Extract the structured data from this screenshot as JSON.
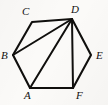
{
  "figure": {
    "type": "geometry-diagram",
    "shape_name": "hexagon",
    "canvas": {
      "width": 108,
      "height": 105
    },
    "background_color": "#fbfaf8",
    "line_color": "#100f0d",
    "label_color": "#121110",
    "vertices": [
      {
        "id": "A",
        "label": "A",
        "x": 30,
        "y": 88,
        "label_x": 24,
        "label_y": 90
      },
      {
        "id": "B",
        "label": "B",
        "x": 13,
        "y": 55,
        "label_x": 1,
        "label_y": 50
      },
      {
        "id": "C",
        "label": "C",
        "x": 32,
        "y": 22,
        "label_x": 22,
        "label_y": 6
      },
      {
        "id": "D",
        "label": "D",
        "x": 72,
        "y": 19,
        "label_x": 71,
        "label_y": 4
      },
      {
        "id": "E",
        "label": "E",
        "x": 91,
        "y": 55,
        "label_x": 96,
        "label_y": 50
      },
      {
        "id": "F",
        "label": "F",
        "x": 73,
        "y": 88,
        "label_x": 76,
        "label_y": 90
      }
    ],
    "outline_path": "M 30 88 L 13 55 L 32 22 L 72 19 L 91 55 L 73 88 Z",
    "edges": [
      {
        "from": "A",
        "to": "B"
      },
      {
        "from": "B",
        "to": "C"
      },
      {
        "from": "C",
        "to": "D"
      },
      {
        "from": "D",
        "to": "E"
      },
      {
        "from": "E",
        "to": "F"
      },
      {
        "from": "F",
        "to": "A"
      }
    ],
    "diagonals": [
      {
        "from": "D",
        "to": "B",
        "path": "M 72 19 L 13 55"
      },
      {
        "from": "D",
        "to": "A",
        "path": "M 72 19 L 30 88"
      },
      {
        "from": "D",
        "to": "F",
        "path": "M 72 19 L 73 88"
      }
    ]
  }
}
